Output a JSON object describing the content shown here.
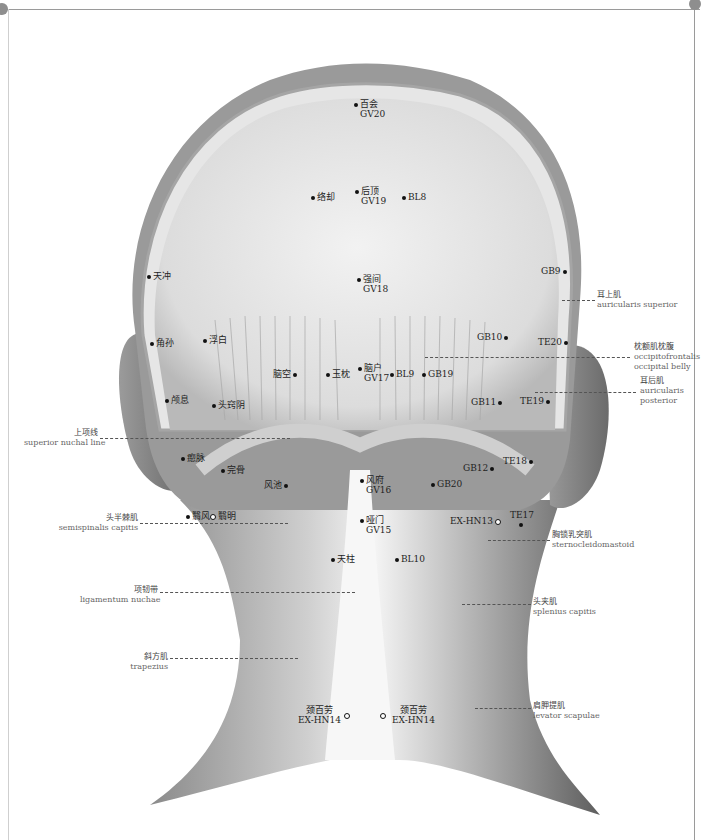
{
  "figure": {
    "colors": {
      "frame": "#9a9a9a",
      "ink": "#111111",
      "skin_dark": "#6f6f6f",
      "skin_light": "#d9d9d9"
    }
  },
  "points": [
    {
      "zh": "百会",
      "code": "GV20",
      "x": 356,
      "y": 104,
      "marker": "dot"
    },
    {
      "zh": "络却",
      "code": "",
      "x": 313,
      "y": 197,
      "marker": "dot"
    },
    {
      "zh": "后顶",
      "code": "GV19",
      "x": 357,
      "y": 190,
      "marker": "dot"
    },
    {
      "zh": "",
      "code": "BL8",
      "x": 404,
      "y": 197,
      "marker": "dot"
    },
    {
      "zh": "天冲",
      "code": "",
      "x": 149,
      "y": 276,
      "marker": "dot"
    },
    {
      "zh": "强间",
      "code": "GV18",
      "x": 359,
      "y": 278,
      "marker": "dot"
    },
    {
      "zh": "",
      "code": "GB9",
      "x": 562,
      "y": 271,
      "marker": "dot"
    },
    {
      "zh": "角孙",
      "code": "",
      "x": 152,
      "y": 343,
      "marker": "dot"
    },
    {
      "zh": "浮白",
      "code": "",
      "x": 205,
      "y": 340,
      "marker": "dot"
    },
    {
      "zh": "",
      "code": "GB10",
      "x": 502,
      "y": 337,
      "marker": "dot"
    },
    {
      "zh": "",
      "code": "TE20",
      "x": 563,
      "y": 342,
      "marker": "dot"
    },
    {
      "zh": "脑空",
      "code": "",
      "x": 295,
      "y": 374,
      "marker": "dot"
    },
    {
      "zh": "玉枕",
      "code": "",
      "x": 328,
      "y": 374,
      "marker": "dot"
    },
    {
      "zh": "脑户",
      "code": "GV17",
      "x": 360,
      "y": 367,
      "marker": "dot"
    },
    {
      "zh": "",
      "code": "BL9",
      "x": 392,
      "y": 374,
      "marker": "dot"
    },
    {
      "zh": "",
      "code": "GB19",
      "x": 424,
      "y": 374,
      "marker": "dot"
    },
    {
      "zh": "颅息",
      "code": "",
      "x": 167,
      "y": 400,
      "marker": "dot"
    },
    {
      "zh": "头窍阴",
      "code": "",
      "x": 214,
      "y": 405,
      "marker": "dot"
    },
    {
      "zh": "",
      "code": "GB11",
      "x": 497,
      "y": 402,
      "marker": "dot"
    },
    {
      "zh": "",
      "code": "TE19",
      "x": 545,
      "y": 401,
      "marker": "dot"
    },
    {
      "zh": "瘛脉",
      "code": "",
      "x": 183,
      "y": 458,
      "marker": "dot"
    },
    {
      "zh": "完骨",
      "code": "",
      "x": 223,
      "y": 470,
      "marker": "dot"
    },
    {
      "zh": "风池",
      "code": "",
      "x": 286,
      "y": 485,
      "marker": "dot"
    },
    {
      "zh": "风府",
      "code": "GV16",
      "x": 362,
      "y": 479,
      "marker": "dot"
    },
    {
      "zh": "",
      "code": "GB20",
      "x": 433,
      "y": 484,
      "marker": "dot"
    },
    {
      "zh": "",
      "code": "GB12",
      "x": 489,
      "y": 468,
      "marker": "dot"
    },
    {
      "zh": "",
      "code": "TE18",
      "x": 529,
      "y": 461,
      "marker": "dot"
    },
    {
      "zh": "翳风",
      "code": "",
      "x": 188,
      "y": 516,
      "marker": "dot"
    },
    {
      "zh": "翳明",
      "code": "",
      "x": 213,
      "y": 516,
      "marker": "ring"
    },
    {
      "zh": "哑门",
      "code": "GV15",
      "x": 362,
      "y": 519,
      "marker": "dot"
    },
    {
      "zh": "",
      "code": "EX-HN13",
      "x": 495,
      "y": 521,
      "marker": "ring"
    },
    {
      "zh": "",
      "code": "TE17",
      "x": 521,
      "y": 520,
      "marker": "dot"
    },
    {
      "zh": "天柱",
      "code": "",
      "x": 333,
      "y": 559,
      "marker": "dot"
    },
    {
      "zh": "",
      "code": "BL10",
      "x": 397,
      "y": 559,
      "marker": "dot"
    },
    {
      "zh": "颈百劳",
      "code": "EX-HN14",
      "x": 346,
      "y": 714,
      "marker": "ring"
    },
    {
      "zh": "颈百劳",
      "code": "EX-HN14",
      "x": 382,
      "y": 714,
      "marker": "ring"
    }
  ],
  "structures": [
    {
      "zh": "耳上肌",
      "en": "auricularis superior",
      "side": "right",
      "x": 597,
      "y": 295,
      "line_from": 562,
      "line_to": 595
    },
    {
      "zh": "枕额肌枕腹",
      "en": "occipitofrontalis\noccipital belly",
      "side": "right",
      "x": 634,
      "y": 346,
      "line_from": 425,
      "line_to": 630
    },
    {
      "zh": "耳后肌",
      "en": "auricularis\nposterior",
      "side": "right",
      "x": 640,
      "y": 380,
      "line_from": 535,
      "line_to": 636
    },
    {
      "zh": "上项线",
      "en": "superior nuchal line",
      "side": "left",
      "x": 26,
      "y": 433,
      "line_from": 100,
      "line_to": 290
    },
    {
      "zh": "头半棘肌",
      "en": "semispinalis capitis",
      "side": "left",
      "x": 30,
      "y": 518,
      "line_from": 140,
      "line_to": 288
    },
    {
      "zh": "胸锁乳突肌",
      "en": "sternocleidomastoid",
      "side": "right",
      "x": 552,
      "y": 534,
      "line_from": 488,
      "line_to": 550
    },
    {
      "zh": "项韧带",
      "en": "ligamentum nuchae",
      "side": "left",
      "x": 84,
      "y": 584,
      "line_from": 160,
      "line_to": 355
    },
    {
      "zh": "头夹肌",
      "en": "splenius capitis",
      "side": "right",
      "x": 533,
      "y": 598,
      "line_from": 462,
      "line_to": 531
    },
    {
      "zh": "斜方肌",
      "en": "trapezius",
      "side": "left",
      "x": 137,
      "y": 652,
      "line_from": 170,
      "line_to": 298
    },
    {
      "zh": "肩胛提肌",
      "en": "levator scapulae",
      "side": "right",
      "x": 533,
      "y": 703,
      "line_from": 475,
      "line_to": 531
    }
  ]
}
